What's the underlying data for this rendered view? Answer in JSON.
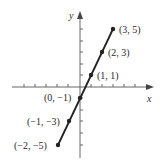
{
  "axes": {
    "x_label": "x",
    "y_label": "y"
  },
  "points": [
    {
      "label": "(3, 5)",
      "x": 3,
      "y": 5
    },
    {
      "label": "(2, 3)",
      "x": 2,
      "y": 3
    },
    {
      "label": "(1, 1)",
      "x": 1,
      "y": 1
    },
    {
      "label": "(0, −1)",
      "x": 0,
      "y": -1
    },
    {
      "label": "(−1, −3)",
      "x": -1,
      "y": -3
    },
    {
      "label": "(−2, −5)",
      "x": -2,
      "y": -5
    }
  ],
  "colors": {
    "line": "#222222",
    "axis": "#555555"
  }
}
